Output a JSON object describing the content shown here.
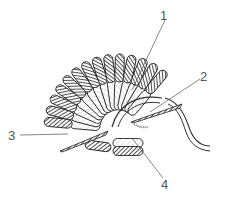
{
  "figure": {
    "type": "technical line illustration",
    "labels": [
      {
        "id": "1",
        "text": "1",
        "x": 163,
        "y": 12
      },
      {
        "id": "2",
        "text": "2",
        "x": 202,
        "y": 72
      },
      {
        "id": "3",
        "text": "3",
        "x": 8,
        "y": 130
      },
      {
        "id": "4",
        "text": "4",
        "x": 163,
        "y": 180
      }
    ],
    "colors": {
      "ink": "#333333",
      "dark_fill": "#777777",
      "light_fill": "#ffffff",
      "label_text": "#555555"
    }
  }
}
